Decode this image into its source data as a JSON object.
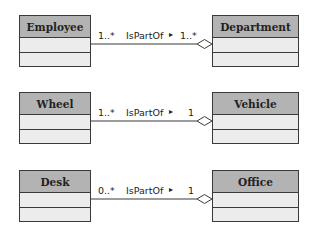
{
  "relations": [
    {
      "whole": "Department",
      "part": "Employee",
      "part_multiplicity": "1..*",
      "whole_multiplicity": "1..*",
      "name": "IsPartOf",
      "direction_arrow": "▸"
    },
    {
      "whole": "Vehicle",
      "part": "Wheel",
      "part_multiplicity": "1..*",
      "whole_multiplicity": "1",
      "name": "IsPartOf",
      "direction_arrow": "▸"
    },
    {
      "whole": "Office",
      "part": "Desk",
      "part_multiplicity": "0..*",
      "whole_multiplicity": "1",
      "name": "IsPartOf",
      "direction_arrow": "▸"
    }
  ],
  "colors": {
    "header": "#b3b3b3",
    "body": "#ececec",
    "stroke": "#3a3a3a"
  }
}
